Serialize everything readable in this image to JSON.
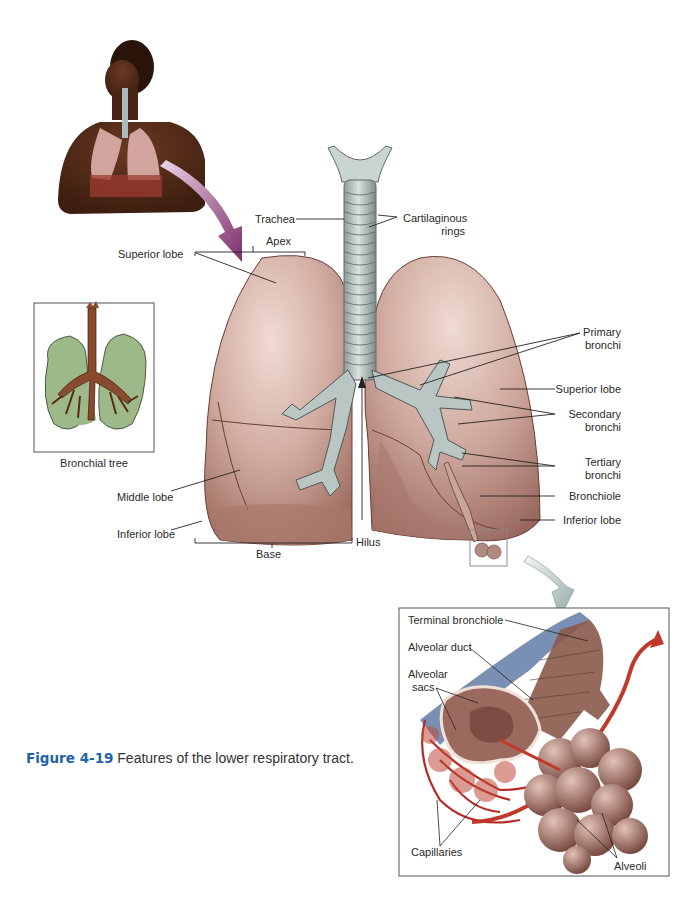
{
  "figure": {
    "number": "Figure 4-19",
    "caption": "Features of the lower respiratory tract."
  },
  "colors": {
    "lung_fill": "#c49a8e",
    "lung_highlight": "#ecd6cf",
    "lung_shadow": "#8a5a4e",
    "trachea": "#b9c6c4",
    "trachea_shadow": "#7e8c8a",
    "bronchial_tree_green": "#9db889",
    "bronchial_tree_brown": "#8a4a2e",
    "arrow_purple": "#8e3f7c",
    "arrow_gray": "#a9bcbb",
    "capillary_red": "#c0392b",
    "capillary_blue": "#4c6a9a",
    "caption_blue": "#1e63a8"
  },
  "inset_bronchial_tree": {
    "label": "Bronchial tree"
  },
  "main_labels": {
    "trachea": "Trachea",
    "cartilaginous_rings_1": "Cartilaginous",
    "cartilaginous_rings_2": "rings",
    "apex": "Apex",
    "superior_lobe_left": "Superior lobe",
    "middle_lobe": "Middle lobe",
    "inferior_lobe_left": "Inferior lobe",
    "base": "Base",
    "hilus": "Hilus",
    "primary_bronchi_1": "Primary",
    "primary_bronchi_2": "bronchi",
    "superior_lobe_right": "Superior lobe",
    "secondary_bronchi_1": "Secondary",
    "secondary_bronchi_2": "bronchi",
    "tertiary_bronchi_1": "Tertiary",
    "tertiary_bronchi_2": "bronchi",
    "bronchiole": "Bronchiole",
    "inferior_lobe_right": "Inferior lobe"
  },
  "alveoli_inset": {
    "terminal_bronchiole": "Terminal bronchiole",
    "alveolar_duct": "Alveolar duct",
    "alveolar_sacs_1": "Alveolar",
    "alveolar_sacs_2": "sacs",
    "capillaries": "Capillaries",
    "alveoli": "Alveoli"
  }
}
